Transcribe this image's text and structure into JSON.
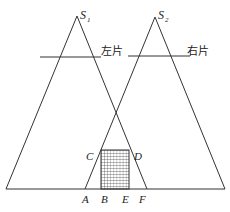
{
  "diagram": {
    "type": "stereo-view projection diagram",
    "sources": [
      {
        "id": "S1",
        "label": "S",
        "subscript": "1",
        "apex": [
          77,
          16
        ]
      },
      {
        "id": "S2",
        "label": "S",
        "subscript": "2",
        "apex": [
          155,
          17
        ]
      }
    ],
    "filters": [
      {
        "label": "左片",
        "line": [
          40,
          57,
          101,
          57
        ]
      },
      {
        "label": "右片",
        "line": [
          128,
          56,
          190,
          56
        ]
      }
    ],
    "baseline_points": {
      "A": "A",
      "B": "B",
      "E": "E",
      "F": "F"
    },
    "side_points": {
      "C": "C",
      "D": "D"
    },
    "overlap_region": "hatched rectangle BCDE",
    "colors": {
      "line": "#333333",
      "background": "#ffffff"
    }
  }
}
